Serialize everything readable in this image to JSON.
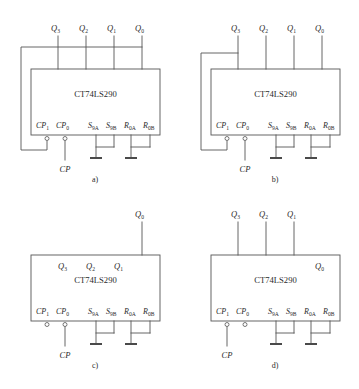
{
  "figure": {
    "chip_name": "CT74LS290",
    "clock_label": "CP",
    "pin_labels": {
      "cp1": "CP",
      "cp1_sub": "1",
      "cp0": "CP",
      "cp0_sub": "0",
      "s9a": "S",
      "s9a_sub": "9A",
      "s9b": "S",
      "s9b_sub": "9B",
      "r0a": "R",
      "r0a_sub": "0A",
      "r0b": "R",
      "r0b_sub": "0B"
    },
    "outputs": {
      "q3": "Q",
      "q3_sub": "3",
      "q2": "Q",
      "q2_sub": "2",
      "q1": "Q",
      "q1_sub": "1",
      "q0": "Q",
      "q0_sub": "0"
    },
    "colors": {
      "wire": "#555555",
      "text": "#2b2b2b",
      "background": "#ffffff"
    },
    "panels": [
      {
        "id": "a",
        "caption": "a)",
        "chip": "CT74LS290",
        "clock": "CP",
        "external_outputs": [
          "Q3",
          "Q2",
          "Q1",
          "Q0"
        ],
        "internal_outputs": [],
        "feedback_from": "Q0",
        "feedback_to": "CP1",
        "clock_input": "CP0"
      },
      {
        "id": "b",
        "caption": "b)",
        "chip": "CT74LS290",
        "clock": "CP",
        "external_outputs": [
          "Q3",
          "Q2",
          "Q1",
          "Q0"
        ],
        "internal_outputs": [],
        "feedback_from": "Q3",
        "feedback_to": "CP1",
        "clock_input": "CP0"
      },
      {
        "id": "c",
        "caption": "c)",
        "chip": "CT74LS290",
        "clock": "CP",
        "external_outputs": [
          "Q0"
        ],
        "internal_outputs": [
          "Q3",
          "Q2",
          "Q1"
        ],
        "feedback_from": null,
        "feedback_to": null,
        "clock_input": "CP0"
      },
      {
        "id": "d",
        "caption": "d)",
        "chip": "CT74LS290",
        "clock": "CP",
        "external_outputs": [
          "Q3",
          "Q2",
          "Q1"
        ],
        "internal_outputs": [
          "Q0"
        ],
        "feedback_from": null,
        "feedback_to": null,
        "clock_input": "CP1"
      }
    ]
  }
}
